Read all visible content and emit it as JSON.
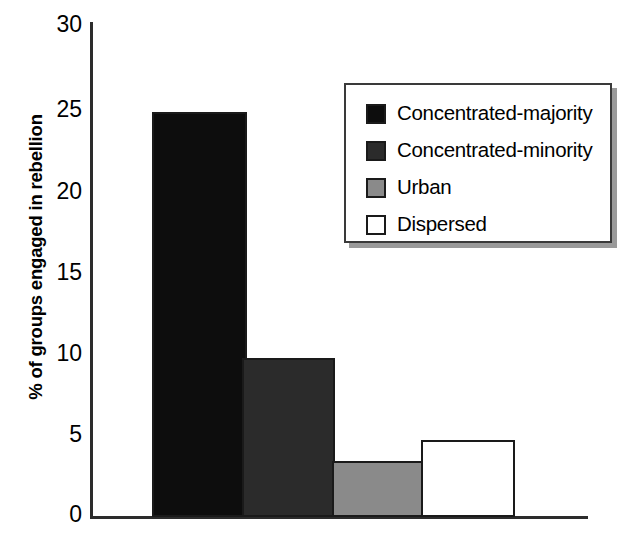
{
  "chart_data": {
    "type": "bar",
    "title": "",
    "xlabel": "",
    "ylabel": "% of groups engaged in rebellion",
    "categories": [
      "Concentrated-majority",
      "Concentrated-minority",
      "Urban",
      "Dispersed"
    ],
    "values": [
      24.7,
      9.7,
      3.4,
      4.7
    ],
    "ylim": [
      0,
      30
    ],
    "yticks": [
      0,
      5,
      10,
      15,
      20,
      25,
      30
    ],
    "ytick_labels": [
      "0",
      "5",
      "10",
      "15",
      "20",
      "25",
      "30"
    ],
    "grid": false,
    "legend_position": "upper-right",
    "series_colors": [
      "#0d0d0d",
      "#2b2b2b",
      "#8a8a8a",
      "#ffffff"
    ]
  },
  "axis": {
    "y_title": "% of groups engaged in rebellion",
    "tick_labels": [
      "30",
      "25",
      "20",
      "15",
      "10",
      "5",
      "0"
    ]
  },
  "legend": {
    "entries": [
      {
        "label": "Concentrated-majority",
        "color": "#0d0d0d"
      },
      {
        "label": "Concentrated-minority",
        "color": "#2b2b2b"
      },
      {
        "label": "Urban",
        "color": "#8a8a8a"
      },
      {
        "label": "Dispersed",
        "color": "#ffffff"
      }
    ]
  }
}
